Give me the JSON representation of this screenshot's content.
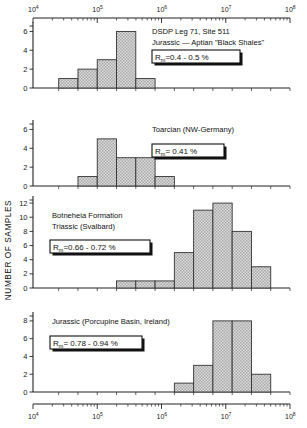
{
  "figure": {
    "ylabel": "NUMBER OF SAMPLES",
    "x_axis": {
      "type": "log",
      "min": 10000,
      "max": 100000000,
      "decade_labels": [
        "10",
        "10",
        "10",
        "10",
        "10"
      ],
      "decade_exponents": [
        "4",
        "5",
        "6",
        "7",
        "8"
      ],
      "tick_values": [
        10000,
        100000,
        1000000,
        10000000,
        100000000
      ]
    }
  },
  "chart_data": [
    {
      "type": "bar",
      "panel": 1,
      "title": "DSDP  Leg 71, Site 511",
      "subtitle": "Jurassic — Aptian \"Black Shales\"",
      "rm_prefix": "R",
      "rm_sub": "m",
      "rm_value": "=0.4 - 0.5 %",
      "xlabel": "",
      "ylabel": "NUMBER OF SAMPLES",
      "xscale": "log",
      "xlim": [
        10000,
        100000000
      ],
      "ylim": [
        0,
        7
      ],
      "yticks": [
        0,
        2,
        4,
        6
      ],
      "bin_edges_log": [
        4.4,
        4.7,
        5.0,
        5.3,
        5.6,
        5.9
      ],
      "values": [
        1,
        2,
        3,
        6,
        1
      ],
      "grid": false,
      "legend": "none"
    },
    {
      "type": "bar",
      "panel": 2,
      "title": "Toarcian (NW-Germany)",
      "subtitle": "",
      "rm_prefix": "R",
      "rm_sub": "m",
      "rm_value": "= 0.41 %",
      "xlabel": "",
      "ylabel": "NUMBER OF SAMPLES",
      "xscale": "log",
      "xlim": [
        10000,
        100000000
      ],
      "ylim": [
        0,
        7
      ],
      "yticks": [
        0,
        2,
        4,
        6
      ],
      "bin_edges_log": [
        4.7,
        5.0,
        5.3,
        5.6,
        5.9,
        6.2
      ],
      "values": [
        1,
        5,
        3,
        3,
        1
      ],
      "grid": false,
      "legend": "none"
    },
    {
      "type": "bar",
      "panel": 3,
      "title": "Botneheia Formation",
      "subtitle": "Triassic (Svalbard)",
      "rm_prefix": "R",
      "rm_sub": "m",
      "rm_value": "=0.66 - 0.72 %",
      "xlabel": "",
      "ylabel": "NUMBER OF SAMPLES",
      "xscale": "log",
      "xlim": [
        10000,
        100000000
      ],
      "ylim": [
        0,
        13
      ],
      "yticks": [
        0,
        2,
        4,
        6,
        8,
        10,
        12
      ],
      "bin_edges_log": [
        5.3,
        5.6,
        5.9,
        6.2,
        6.5,
        6.8,
        7.1,
        7.4,
        7.7
      ],
      "values": [
        1,
        1,
        1,
        5,
        11,
        12,
        8,
        3
      ],
      "grid": false,
      "legend": "none"
    },
    {
      "type": "bar",
      "panel": 4,
      "title": "Jurassic (Porcupine Basin, Ireland)",
      "subtitle": "",
      "rm_prefix": "R",
      "rm_sub": "m",
      "rm_value": "= 0.78 - 0.94 %",
      "xlabel": "",
      "ylabel": "NUMBER OF SAMPLES",
      "xscale": "log",
      "xlim": [
        10000,
        100000000
      ],
      "ylim": [
        0,
        9
      ],
      "yticks": [
        0,
        2,
        4,
        6,
        8
      ],
      "bin_edges_log": [
        6.2,
        6.5,
        6.8,
        7.1,
        7.4,
        7.7
      ],
      "values": [
        1,
        3,
        8,
        8,
        2
      ],
      "grid": false,
      "legend": "none"
    }
  ]
}
